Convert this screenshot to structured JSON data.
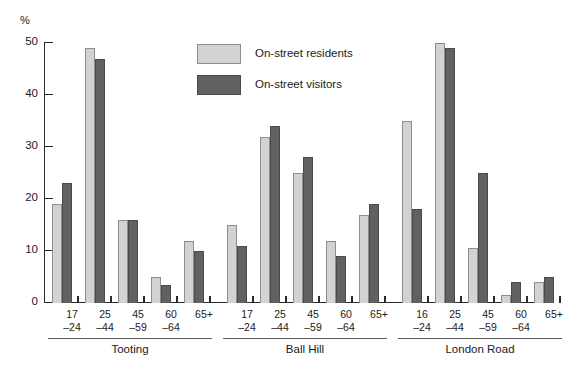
{
  "chart_data": {
    "type": "bar",
    "title": "",
    "xlabel": "",
    "ylabel": "%",
    "ylim": [
      0,
      50
    ],
    "yticks": [
      0,
      10,
      20,
      30,
      40,
      50
    ],
    "grid": false,
    "legend_position": "inside-top-center",
    "groups": [
      {
        "name": "Tooting",
        "categories": [
          "17–24",
          "25–44",
          "45–59",
          "60–64",
          "65+"
        ],
        "series": [
          {
            "name": "On-street residents",
            "values": [
              19,
              49,
              16,
              5,
              12
            ]
          },
          {
            "name": "On-street visitors",
            "values": [
              23,
              47,
              16,
              3.5,
              10
            ]
          }
        ]
      },
      {
        "name": "Ball Hill",
        "categories": [
          "17–24",
          "25–44",
          "45–59",
          "60–64",
          "65+"
        ],
        "series": [
          {
            "name": "On-street residents",
            "values": [
              15,
              32,
              25,
              12,
              17
            ]
          },
          {
            "name": "On-street visitors",
            "values": [
              11,
              34,
              28,
              9,
              19
            ]
          }
        ]
      },
      {
        "name": "London Road",
        "categories": [
          "16–24",
          "25–44",
          "45–59",
          "60–64",
          "65+"
        ],
        "series": [
          {
            "name": "On-street residents",
            "values": [
              35,
              50,
              10.5,
              1.5,
              4
            ]
          },
          {
            "name": "On-street visitors",
            "values": [
              18,
              49,
              25,
              4,
              5
            ]
          }
        ]
      }
    ],
    "series_colors": {
      "On-street residents": "#d2d2d2",
      "On-street visitors": "#616161"
    }
  },
  "axis": {
    "unit_label": "%",
    "tick_labels": [
      "0",
      "10",
      "20",
      "30",
      "40",
      "50"
    ]
  },
  "legend": {
    "entries": [
      {
        "label": "On-street residents",
        "swatch": "light"
      },
      {
        "label": "On-street visitors",
        "swatch": "dark"
      }
    ]
  },
  "category_labels": [
    {
      "line1": "17",
      "line2": "–24"
    },
    {
      "line1": "25",
      "line2": "–44"
    },
    {
      "line1": "45",
      "line2": "–59"
    },
    {
      "line1": "60",
      "line2": "–64"
    },
    {
      "line1": "65+",
      "line2": ""
    },
    {
      "line1": "17",
      "line2": "–24"
    },
    {
      "line1": "25",
      "line2": "–44"
    },
    {
      "line1": "45",
      "line2": "–59"
    },
    {
      "line1": "60",
      "line2": "–64"
    },
    {
      "line1": "65+",
      "line2": ""
    },
    {
      "line1": "16",
      "line2": "–24"
    },
    {
      "line1": "25",
      "line2": "–44"
    },
    {
      "line1": "45",
      "line2": "–59"
    },
    {
      "line1": "60",
      "line2": "–64"
    },
    {
      "line1": "65+",
      "line2": ""
    }
  ],
  "group_labels": [
    "Tooting",
    "Ball Hill",
    "London Road"
  ]
}
